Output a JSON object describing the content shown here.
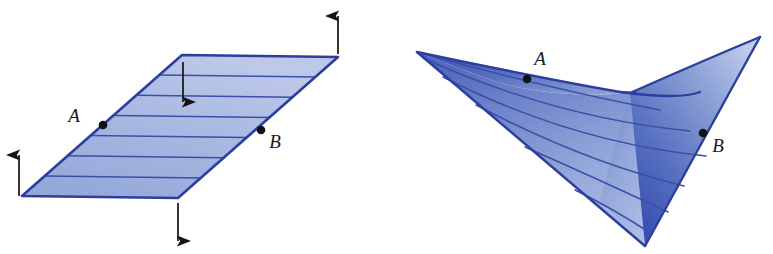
{
  "figure": {
    "caption": "",
    "panels": [
      {
        "id": "left-panel",
        "name": "flat-ruled-plane",
        "label_a": "A",
        "label_b": "B",
        "ruling_line_count": 6,
        "arrow_count": 4,
        "arrows": [
          {
            "name": "arrow-up-left",
            "direction": "up"
          },
          {
            "name": "arrow-down-top",
            "direction": "down"
          },
          {
            "name": "arrow-up-right",
            "direction": "up"
          },
          {
            "name": "arrow-down-bottom",
            "direction": "down"
          }
        ]
      },
      {
        "id": "right-panel",
        "name": "twisted-ruled-surface",
        "label_a": "A",
        "label_b": "B",
        "ruling_line_count": 6,
        "arrow_count": 0
      }
    ]
  },
  "colors": {
    "edge_blue": "#2d3f9e",
    "fill_light": "#aebde8",
    "fill_mid": "#8ba0d8",
    "fill_deep": "#3f57b5",
    "rule_line": "#3a4fa8",
    "marker_black": "#111111",
    "background": "#ffffff"
  }
}
